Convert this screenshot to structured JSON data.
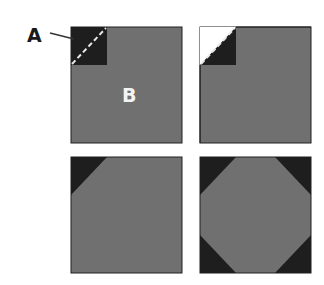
{
  "labels": {
    "a": "A",
    "b": "B"
  },
  "colors": {
    "fabric": "#707070",
    "corner": "#1e1e1e",
    "outline": "#202020",
    "stitch": "#e8e8e8",
    "label_dark": "#1a1a1a",
    "label_light": "#f4f4f4"
  },
  "panels": [
    {
      "id": "step-1",
      "description": "Square B with small dark square A placed on top-left corner, dashed diagonal stitch line"
    },
    {
      "id": "step-2",
      "description": "Corner sewn and trimmed along diagonal, folded back"
    },
    {
      "id": "step-3",
      "description": "Square with one snowball corner"
    },
    {
      "id": "step-4",
      "description": "Square with four snowball corners forming octagon center"
    }
  ]
}
